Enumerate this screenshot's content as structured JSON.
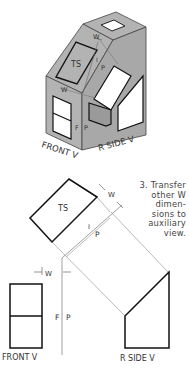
{
  "isometric": {
    "labels": {
      "ts": "TS",
      "w_top": "W",
      "w_mid": "W",
      "i": "I",
      "p_upper": "P",
      "f": "F",
      "p_lower": "P",
      "front_v": "FRONT V",
      "r_side_v": "R SIDE V"
    },
    "colors": {
      "face": "#b3b3b3",
      "window": "#ffffff",
      "edge": "#222222"
    }
  },
  "orthographic": {
    "labels": {
      "ts": "TS",
      "w_aux": "W",
      "i": "I",
      "p_upper": "P",
      "w_front": "W",
      "f": "F",
      "p_lower": "P",
      "front_v": "FRONT V",
      "r_side_v": "R SIDE V"
    },
    "note": {
      "lines": [
        "3. Transfer",
        "other W",
        "dimen-",
        "sions to",
        "auxiliary",
        "view."
      ]
    },
    "colors": {
      "object_line": "#222222",
      "projection_line": "#aaaaaa"
    }
  }
}
